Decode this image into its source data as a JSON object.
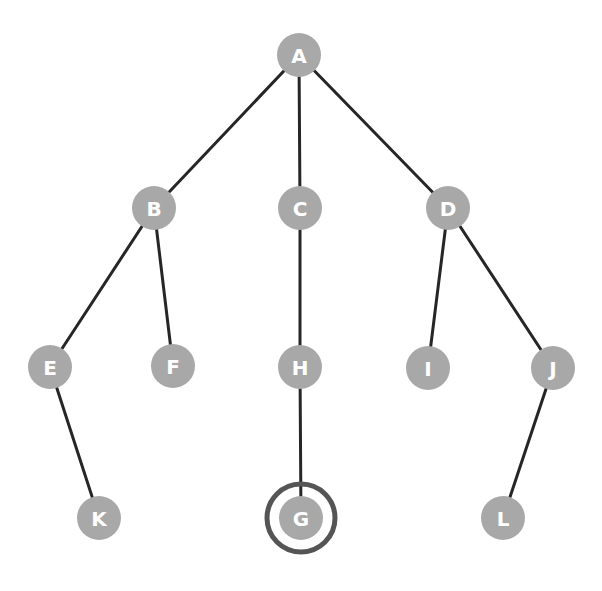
{
  "diagram": {
    "type": "tree-graph",
    "title": "",
    "canvas": {
      "width": 602,
      "height": 591,
      "background": "#ffffff"
    },
    "style": {
      "node_fill": "#a8a8a8",
      "node_radius": 22,
      "node_label_color": "#ffffff",
      "node_label_size": 20,
      "edge_color": "#262626",
      "edge_width": 3,
      "highlight_ring_color": "#555555",
      "highlight_ring_width": 5,
      "highlight_ring_radius": 34
    },
    "nodes": [
      {
        "id": "A",
        "label": "A",
        "x": 299,
        "y": 55,
        "highlighted": false
      },
      {
        "id": "B",
        "label": "B",
        "x": 154,
        "y": 208,
        "highlighted": false
      },
      {
        "id": "C",
        "label": "C",
        "x": 300,
        "y": 208,
        "highlighted": false
      },
      {
        "id": "D",
        "label": "D",
        "x": 448,
        "y": 208,
        "highlighted": false
      },
      {
        "id": "E",
        "label": "E",
        "x": 50,
        "y": 367,
        "highlighted": false
      },
      {
        "id": "F",
        "label": "F",
        "x": 173,
        "y": 366,
        "highlighted": false
      },
      {
        "id": "H",
        "label": "H",
        "x": 300,
        "y": 367,
        "highlighted": false
      },
      {
        "id": "I",
        "label": "I",
        "x": 428,
        "y": 368,
        "highlighted": false
      },
      {
        "id": "J",
        "label": "J",
        "x": 553,
        "y": 368,
        "highlighted": false
      },
      {
        "id": "K",
        "label": "K",
        "x": 99,
        "y": 518,
        "highlighted": false
      },
      {
        "id": "G",
        "label": "G",
        "x": 301,
        "y": 518,
        "highlighted": true
      },
      {
        "id": "L",
        "label": "L",
        "x": 503,
        "y": 518,
        "highlighted": false
      }
    ],
    "edges": [
      {
        "from": "A",
        "to": "B"
      },
      {
        "from": "A",
        "to": "C"
      },
      {
        "from": "A",
        "to": "D"
      },
      {
        "from": "B",
        "to": "E"
      },
      {
        "from": "B",
        "to": "F"
      },
      {
        "from": "C",
        "to": "H"
      },
      {
        "from": "D",
        "to": "I"
      },
      {
        "from": "D",
        "to": "J"
      },
      {
        "from": "E",
        "to": "K"
      },
      {
        "from": "H",
        "to": "G"
      },
      {
        "from": "J",
        "to": "L"
      }
    ]
  }
}
